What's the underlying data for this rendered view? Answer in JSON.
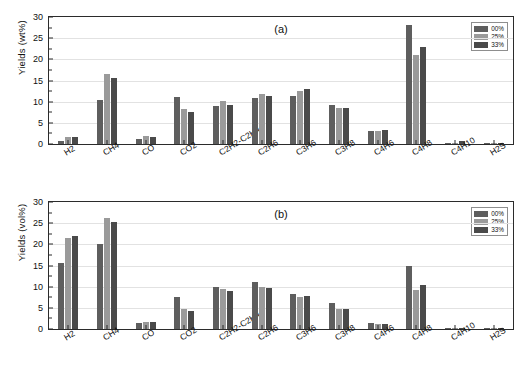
{
  "chart_data": [
    {
      "type": "bar",
      "panel": "(a)",
      "title": "",
      "xlabel": "",
      "ylabel": "Yields (wt%)",
      "ylim": [
        0,
        30
      ],
      "yticks": [
        0,
        5,
        10,
        15,
        20,
        25,
        30
      ],
      "grid": true,
      "legend_position": "top-right",
      "categories": [
        "H2",
        "CH4",
        "CO",
        "CO2",
        "C2H2-C2H4",
        "C2H6",
        "C3H6",
        "C3H8",
        "C4H6",
        "C4H8",
        "C4H10",
        "H2S"
      ],
      "series": [
        {
          "name": "00%",
          "color": "#5e5e5e",
          "values": [
            0.8,
            10.5,
            1.2,
            11.1,
            8.9,
            10.8,
            11.3,
            9.2,
            3.1,
            28.2,
            0.3,
            0.2
          ]
        },
        {
          "name": "25%",
          "color": "#9a9a9a",
          "values": [
            1.6,
            16.6,
            1.8,
            8.2,
            10.1,
            11.9,
            12.5,
            8.5,
            3.1,
            21.0,
            0.2,
            0.2
          ]
        },
        {
          "name": "33%",
          "color": "#4a4a4a",
          "values": [
            1.6,
            15.7,
            1.7,
            7.5,
            9.2,
            11.3,
            12.9,
            8.4,
            3.3,
            23.0,
            0.7,
            0.3
          ]
        }
      ]
    },
    {
      "type": "bar",
      "panel": "(b)",
      "title": "",
      "xlabel": "",
      "ylabel": "Yields (vol%)",
      "ylim": [
        0,
        30
      ],
      "yticks": [
        0,
        5,
        10,
        15,
        20,
        25,
        30
      ],
      "grid": true,
      "legend_position": "top-right",
      "categories": [
        "H2",
        "CH4",
        "CO",
        "CO2",
        "C2H2-C2H4",
        "C2H6",
        "C3H6",
        "C3H8",
        "C4H6",
        "C4H8",
        "C4H10",
        "H2S"
      ],
      "series": [
        {
          "name": "00%",
          "color": "#5e5e5e",
          "values": [
            15.5,
            20.0,
            1.4,
            7.6,
            9.9,
            11.0,
            8.2,
            6.2,
            1.5,
            14.9,
            0.2,
            0.2
          ]
        },
        {
          "name": "25%",
          "color": "#9a9a9a",
          "values": [
            21.6,
            26.3,
            1.7,
            4.7,
            9.4,
            10.0,
            7.5,
            4.7,
            1.1,
            9.3,
            0.1,
            0.2
          ]
        },
        {
          "name": "33%",
          "color": "#4a4a4a",
          "values": [
            21.9,
            25.3,
            1.6,
            4.3,
            8.9,
            9.8,
            7.8,
            4.8,
            1.3,
            10.3,
            0.3,
            0.3
          ]
        }
      ]
    }
  ],
  "panels": [
    {
      "tag": "(a)",
      "ylabel": "Yields (wt%)",
      "legend": {
        "items": [
          {
            "label": "00%"
          },
          {
            "label": "25%"
          },
          {
            "label": "33%"
          }
        ]
      }
    },
    {
      "tag": "(b)",
      "ylabel": "Yields (vol%)",
      "legend": {
        "items": [
          {
            "label": "00%"
          },
          {
            "label": "25%"
          },
          {
            "label": "33%"
          }
        ]
      }
    }
  ],
  "colors": {
    "series_00": "#5e5e5e",
    "series_25": "#9a9a9a",
    "series_33": "#4a4a4a",
    "axis": "#2b2b2b",
    "grid": "#e2e2e2",
    "background": "#ffffff"
  }
}
